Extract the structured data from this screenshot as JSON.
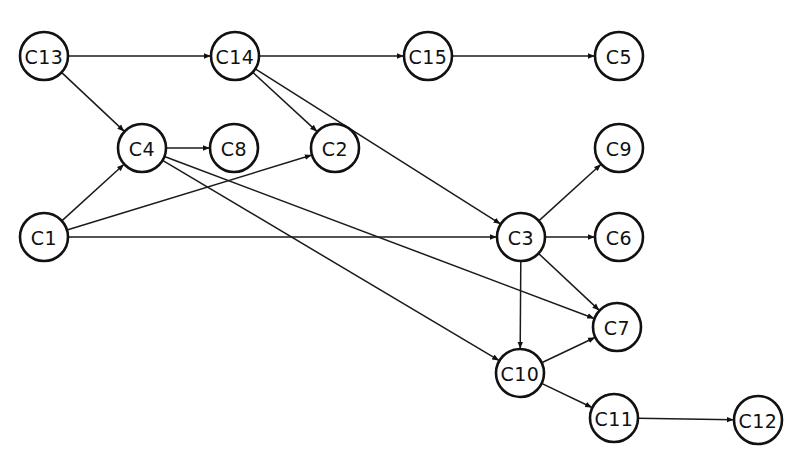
{
  "diagram": {
    "type": "directed-precedence-graph",
    "colors": {
      "stroke": "#111111",
      "fill": "#ffffff",
      "background": "#ffffff"
    },
    "node_radius": 24,
    "nodes": [
      {
        "id": "C13",
        "label": "C13",
        "x": 44,
        "y": 56
      },
      {
        "id": "C14",
        "label": "C14",
        "x": 235,
        "y": 56
      },
      {
        "id": "C15",
        "label": "C15",
        "x": 428,
        "y": 56
      },
      {
        "id": "C5",
        "label": "C5",
        "x": 619,
        "y": 56
      },
      {
        "id": "C4",
        "label": "C4",
        "x": 142,
        "y": 148
      },
      {
        "id": "C8",
        "label": "C8",
        "x": 234,
        "y": 148
      },
      {
        "id": "C2",
        "label": "C2",
        "x": 335,
        "y": 148
      },
      {
        "id": "C9",
        "label": "C9",
        "x": 619,
        "y": 148
      },
      {
        "id": "C1",
        "label": "C1",
        "x": 44,
        "y": 237
      },
      {
        "id": "C3",
        "label": "C3",
        "x": 521,
        "y": 237
      },
      {
        "id": "C6",
        "label": "C6",
        "x": 619,
        "y": 237
      },
      {
        "id": "C7",
        "label": "C7",
        "x": 617,
        "y": 327
      },
      {
        "id": "C10",
        "label": "C10",
        "x": 520,
        "y": 373
      },
      {
        "id": "C11",
        "label": "C11",
        "x": 614,
        "y": 418
      },
      {
        "id": "C12",
        "label": "C12",
        "x": 758,
        "y": 420
      }
    ],
    "edges": [
      {
        "from": "C13",
        "to": "C14"
      },
      {
        "from": "C14",
        "to": "C15"
      },
      {
        "from": "C15",
        "to": "C5"
      },
      {
        "from": "C13",
        "to": "C4"
      },
      {
        "from": "C14",
        "to": "C2"
      },
      {
        "from": "C14",
        "to": "C3"
      },
      {
        "from": "C4",
        "to": "C8"
      },
      {
        "from": "C1",
        "to": "C4"
      },
      {
        "from": "C1",
        "to": "C2"
      },
      {
        "from": "C1",
        "to": "C3"
      },
      {
        "from": "C4",
        "to": "C10"
      },
      {
        "from": "C4",
        "to": "C7"
      },
      {
        "from": "C3",
        "to": "C9"
      },
      {
        "from": "C3",
        "to": "C6"
      },
      {
        "from": "C3",
        "to": "C7"
      },
      {
        "from": "C3",
        "to": "C10"
      },
      {
        "from": "C10",
        "to": "C7"
      },
      {
        "from": "C10",
        "to": "C11"
      },
      {
        "from": "C11",
        "to": "C12"
      }
    ]
  },
  "caption": {
    "text": "",
    "note": "clipped"
  }
}
